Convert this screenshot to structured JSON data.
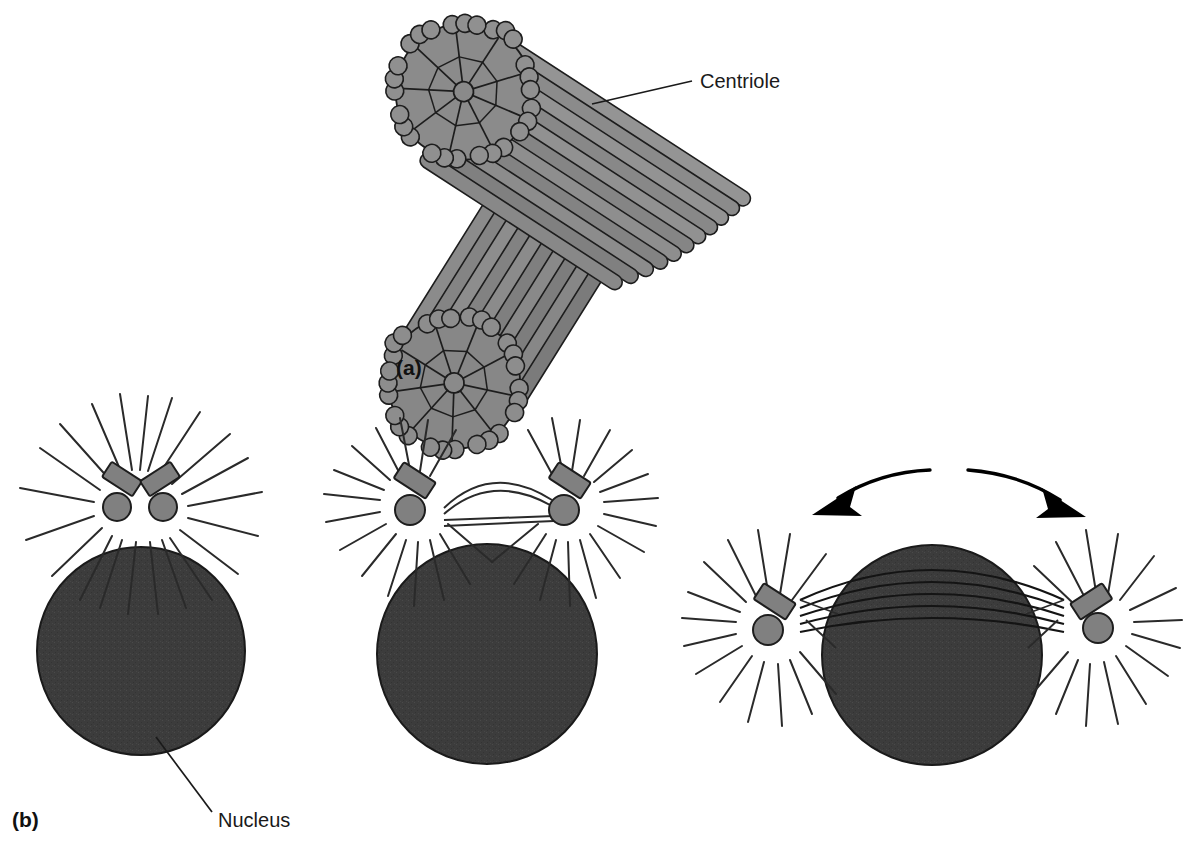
{
  "figure": {
    "background_color": "#ffffff",
    "panels": [
      {
        "id": "a",
        "label": "(a)",
        "label_x": 396,
        "label_y": 375,
        "description": "Pair of centrioles oriented at right angles, each a cylinder of nine microtubule triplets"
      },
      {
        "id": "b",
        "label": "(b)",
        "label_x": 12,
        "label_y": 827,
        "description": "Three stages of centrosome duplication and migration around the nucleus"
      }
    ],
    "callouts": [
      {
        "name": "centriole-label",
        "text": "Centriole",
        "text_x": 700,
        "text_y": 88,
        "leader_from_x": 692,
        "leader_from_y": 81,
        "leader_to_x": 592,
        "leader_to_y": 104
      },
      {
        "name": "nucleus-label",
        "text": "Nucleus",
        "text_x": 218,
        "text_y": 827,
        "leader_from_x": 212,
        "leader_from_y": 812,
        "leader_to_x": 156,
        "leader_to_y": 737
      }
    ],
    "colors": {
      "tubule_fill": "#808080",
      "tubule_fill_light": "#949494",
      "tubule_fill_dark": "#6f6f6f",
      "outline": "#1d1d1d",
      "nucleus_fill": "#3c3c3c",
      "nucleus_outline": "#1a1a1a",
      "microtubule_line": "#2a2a2a",
      "arrow_fill": "#000000",
      "text": "#1a1a1a"
    },
    "centriole_structure": {
      "triplets_per_centriole": 9,
      "cartwheel_hub": true,
      "cylinder_count": 2,
      "relative_orientation_degrees": 90
    }
  },
  "stages": [
    {
      "name": "stage-1-single-centrosome",
      "centrosome_count": 1,
      "centriole_pairs": 2,
      "nucleus": {
        "cx": 141,
        "cy": 651,
        "r": 104
      },
      "aster_centers": [
        {
          "cx": 138,
          "cy": 497
        }
      ],
      "spindle_fibers": 0,
      "migration_arrows": 0
    },
    {
      "name": "stage-2-centrosomes-separating",
      "centrosome_count": 2,
      "centriole_pairs": 2,
      "nucleus": {
        "cx": 487,
        "cy": 654,
        "r": 110
      },
      "aster_centers": [
        {
          "cx": 412,
          "cy": 497
        },
        {
          "cx": 567,
          "cy": 497
        }
      ],
      "spindle_fibers": 4,
      "migration_arrows": 0
    },
    {
      "name": "stage-3-centrosomes-at-poles",
      "centrosome_count": 2,
      "centriole_pairs": 2,
      "nucleus": {
        "cx": 932,
        "cy": 655,
        "r": 110
      },
      "aster_centers": [
        {
          "cx": 770,
          "cy": 620
        },
        {
          "cx": 1095,
          "cy": 620
        }
      ],
      "spindle_fibers": 5,
      "migration_arrows": 2
    }
  ]
}
